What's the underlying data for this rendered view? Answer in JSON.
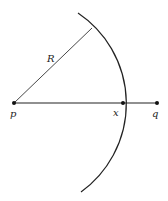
{
  "diagram": {
    "labels": {
      "p": "p",
      "x": "x",
      "q": "q",
      "radius": "R"
    },
    "points": {
      "p": [
        14,
        103
      ],
      "x": [
        123,
        103
      ],
      "q": [
        157,
        103
      ],
      "radius_end": [
        92,
        28
      ]
    },
    "arc": {
      "center": [
        14,
        103
      ],
      "radius": 109,
      "start": [
        78,
        13
      ],
      "end": [
        81,
        192
      ]
    },
    "colors": {
      "stroke": "#222222",
      "background": "#ffffff"
    }
  }
}
